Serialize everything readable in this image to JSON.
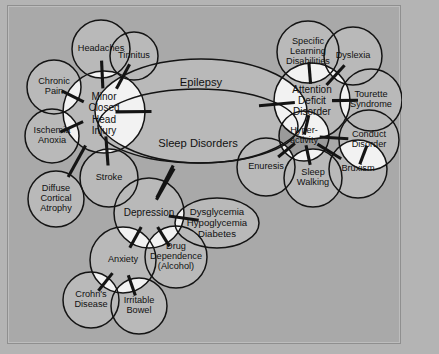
{
  "figure": {
    "credit": "Courtesy of Siegfried and Susan Othmer: EEG Institute",
    "background_color": "#a9a9a9",
    "node_fill": "#b9b9b9",
    "overlap_fill": "#f2f2f2",
    "stroke_color": "#141414",
    "accent_fill": "#9a9a9a"
  },
  "diagram": {
    "type": "venn-overlap-network",
    "nodes": [
      {
        "id": "headaches",
        "label": "Headaches",
        "shape": "circle",
        "cx": 100,
        "cy": 48,
        "r": 29
      },
      {
        "id": "tinnitus",
        "label": "Tinnitus",
        "shape": "circle",
        "cx": 133,
        "cy": 55,
        "r": 24
      },
      {
        "id": "chronic-pain",
        "label": "Chronic|Pain",
        "shape": "circle",
        "cx": 53,
        "cy": 86,
        "r": 27
      },
      {
        "id": "ischemia",
        "label": "Ischemia|Anoxia",
        "shape": "circle",
        "cx": 51,
        "cy": 135,
        "r": 27
      },
      {
        "id": "mchi",
        "label": "Minor|Closed|Head|Injury",
        "shape": "circle",
        "cx": 103,
        "cy": 111,
        "r": 41
      },
      {
        "id": "diffuse",
        "label": "Diffuse|Cortical|Atrophy",
        "shape": "circle",
        "cx": 55,
        "cy": 198,
        "r": 28
      },
      {
        "id": "stroke",
        "label": "Stroke",
        "shape": "circle",
        "cx": 108,
        "cy": 177,
        "r": 29
      },
      {
        "id": "epilepsy",
        "label": "Epilepsy",
        "shape": "ellipse",
        "cx": 200,
        "cy": 110,
        "rx": 106,
        "ry": 52
      },
      {
        "id": "sleep-disorders",
        "label": "Sleep Disorders",
        "shape": "ellipse",
        "cx": 197,
        "cy": 125,
        "rx": 100,
        "ry": 37
      },
      {
        "id": "depression",
        "label": "Depression",
        "shape": "circle",
        "cx": 148,
        "cy": 212,
        "r": 35
      },
      {
        "id": "dysglycemia",
        "label": "Dysglycemia|Hypoglycemia|Diabetes",
        "shape": "ellipse",
        "cx": 216,
        "cy": 222,
        "rx": 42,
        "ry": 25
      },
      {
        "id": "drug-dep",
        "label": "Drug|Dependence|(Alcohol)",
        "shape": "circle",
        "cx": 175,
        "cy": 256,
        "r": 31
      },
      {
        "id": "anxiety",
        "label": "Anxiety",
        "shape": "circle",
        "cx": 122,
        "cy": 259,
        "r": 33
      },
      {
        "id": "crohns",
        "label": "Crohn's|Disease",
        "shape": "circle",
        "cx": 90,
        "cy": 299,
        "r": 28
      },
      {
        "id": "irritable",
        "label": "Irritable|Bowel",
        "shape": "circle",
        "cx": 138,
        "cy": 305,
        "r": 28
      },
      {
        "id": "sld",
        "label": "Specific|Learning|Disabilities",
        "shape": "circle",
        "cx": 307,
        "cy": 51,
        "r": 31
      },
      {
        "id": "dyslexia",
        "label": "Dyslexia",
        "shape": "circle",
        "cx": 352,
        "cy": 55,
        "r": 29
      },
      {
        "id": "add",
        "label": "Attention|Deficit|Disorder",
        "shape": "circle",
        "cx": 311,
        "cy": 100,
        "r": 38
      },
      {
        "id": "tourette",
        "label": "Tourette|Syndrome",
        "shape": "circle",
        "cx": 370,
        "cy": 99,
        "r": 31
      },
      {
        "id": "conduct",
        "label": "Conduct|Disorder",
        "shape": "circle",
        "cx": 368,
        "cy": 139,
        "r": 30
      },
      {
        "id": "hyperactivity",
        "label": "Hyper-|activity",
        "shape": "circle",
        "cx": 303,
        "cy": 135,
        "r": 25
      },
      {
        "id": "enuresis",
        "label": "Enuresis",
        "shape": "circle",
        "cx": 265,
        "cy": 166,
        "r": 29
      },
      {
        "id": "sleep-walking",
        "label": "Sleep|Walking",
        "shape": "circle",
        "cx": 312,
        "cy": 177,
        "r": 29
      },
      {
        "id": "bruxism",
        "label": "Bruxism",
        "shape": "circle",
        "cx": 357,
        "cy": 168,
        "r": 29
      }
    ],
    "links": [
      {
        "from": "chronic-pain",
        "to": "mchi"
      },
      {
        "from": "headaches",
        "to": "mchi"
      },
      {
        "from": "tinnitus",
        "to": "mchi"
      },
      {
        "from": "ischemia",
        "to": "mchi"
      },
      {
        "from": "diffuse",
        "to": "mchi"
      },
      {
        "from": "stroke",
        "to": "mchi"
      },
      {
        "from": "mchi",
        "to": "epilepsy"
      },
      {
        "from": "epilepsy",
        "to": "depression"
      },
      {
        "from": "epilepsy",
        "to": "add"
      },
      {
        "from": "sleep-disorders",
        "to": "depression"
      },
      {
        "from": "depression",
        "to": "dysglycemia"
      },
      {
        "from": "depression",
        "to": "drug-dep"
      },
      {
        "from": "depression",
        "to": "anxiety"
      },
      {
        "from": "anxiety",
        "to": "crohns"
      },
      {
        "from": "anxiety",
        "to": "irritable"
      },
      {
        "from": "sld",
        "to": "add"
      },
      {
        "from": "dyslexia",
        "to": "add"
      },
      {
        "from": "add",
        "to": "tourette"
      },
      {
        "from": "add",
        "to": "hyperactivity"
      },
      {
        "from": "hyperactivity",
        "to": "conduct"
      },
      {
        "from": "hyperactivity",
        "to": "enuresis"
      },
      {
        "from": "hyperactivity",
        "to": "sleep-walking"
      },
      {
        "from": "hyperactivity",
        "to": "bruxism"
      },
      {
        "from": "conduct",
        "to": "bruxism"
      }
    ]
  }
}
